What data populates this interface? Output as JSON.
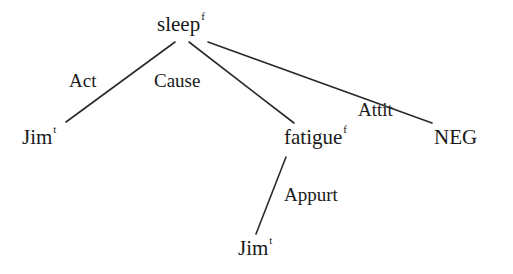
{
  "diagram": {
    "type": "dependency-tree",
    "nodes": [
      {
        "id": "sleep",
        "label": "sleep",
        "superscript": "f"
      },
      {
        "id": "jim1",
        "label": "Jim",
        "superscript": "t"
      },
      {
        "id": "fatigue",
        "label": "fatigue",
        "superscript": "f"
      },
      {
        "id": "neg",
        "label": "NEG",
        "superscript": ""
      },
      {
        "id": "jim2",
        "label": "Jim",
        "superscript": "t"
      }
    ],
    "edges": [
      {
        "from": "sleep",
        "to": "jim1",
        "label": "Act"
      },
      {
        "from": "sleep",
        "to": "fatigue",
        "label": "Cause"
      },
      {
        "from": "sleep",
        "to": "neg",
        "label": "Attit"
      },
      {
        "from": "fatigue",
        "to": "jim2",
        "label": "Appurt"
      }
    ]
  }
}
